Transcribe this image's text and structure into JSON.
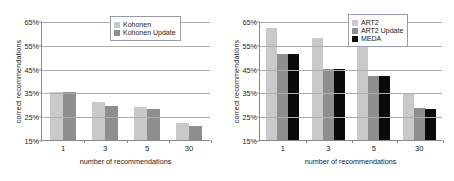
{
  "chart_data": [
    {
      "id": "kohonen-chart",
      "type": "bar",
      "title": "",
      "xlabel": "number of recommendations",
      "ylabel": "correct recommendations",
      "categories": [
        "1",
        "3",
        "5",
        "30"
      ],
      "yticks": [
        "15%",
        "25%",
        "35%",
        "45%",
        "55%",
        "65%"
      ],
      "ylim": [
        15,
        65
      ],
      "grid": true,
      "legend_position": "top-right",
      "series": [
        {
          "name": "Kohonen",
          "color": "#c9c9c9",
          "values": [
            35,
            31,
            29,
            22
          ]
        },
        {
          "name": "Kohonen Update",
          "color": "#8e8e8e",
          "values": [
            35,
            29.5,
            28,
            21
          ]
        }
      ]
    },
    {
      "id": "art2-chart",
      "type": "bar",
      "title": "",
      "xlabel": "number of recommendations",
      "ylabel": "correct recommendations",
      "categories": [
        "1",
        "3",
        "5",
        "30"
      ],
      "yticks": [
        "15%",
        "25%",
        "35%",
        "45%",
        "55%",
        "65%"
      ],
      "ylim": [
        15,
        65
      ],
      "grid": true,
      "legend_position": "top-right",
      "series": [
        {
          "name": "ART2",
          "color": "#c9c9c9",
          "values": [
            62,
            58,
            55,
            34.5
          ]
        },
        {
          "name": "ART2 Update",
          "color": "#8e8e8e",
          "values": [
            51,
            44.8,
            42,
            28.5
          ]
        },
        {
          "name": "MEDA",
          "color": "#0a0a0a",
          "values": [
            51,
            45,
            42,
            28
          ]
        }
      ]
    }
  ]
}
